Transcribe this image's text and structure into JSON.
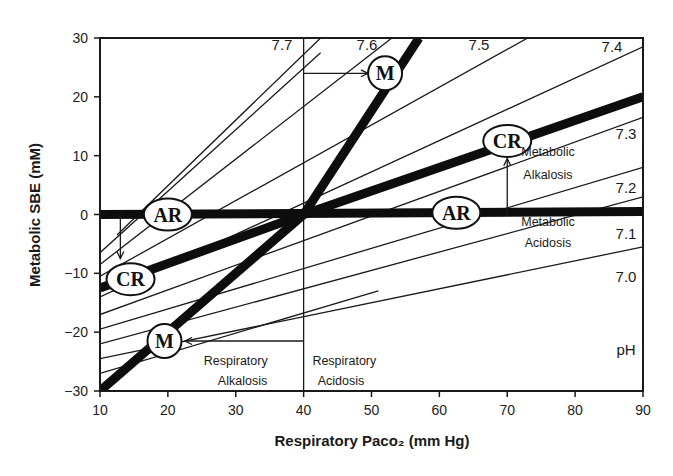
{
  "chart_data": {
    "type": "line",
    "title": "",
    "xlabel": "Respiratory Paco₂ (mm Hg)",
    "ylabel": "Metabolic SBE (mM)",
    "xlim": [
      10,
      90
    ],
    "ylim": [
      -30,
      30
    ],
    "x_ticks": [
      10,
      20,
      30,
      40,
      50,
      60,
      70,
      80,
      90
    ],
    "y_ticks": [
      30,
      20,
      10,
      0,
      -10,
      -20,
      -30
    ],
    "x_tick_labels": [
      "10",
      "20",
      "30",
      "40",
      "50",
      "60",
      "70",
      "80",
      "90"
    ],
    "y_tick_labels": [
      "30",
      "20",
      "10",
      "0",
      "−10",
      "−20",
      "−30"
    ],
    "grid": false,
    "reference_line_x": 40,
    "isopleth_axis_label": "pH",
    "ph_isopleths": [
      {
        "ph": "7.7",
        "points": [
          [
            12.5,
            -3.5
          ],
          [
            42.5,
            30
          ]
        ]
      },
      {
        "ph": "7.7",
        "points": [
          [
            10,
            -6.5
          ],
          [
            42.5,
            27.5
          ]
        ],
        "note": "segment below 7.7 label"
      },
      {
        "ph": "7.6",
        "points": [
          [
            10,
            -8.5
          ],
          [
            53,
            30
          ]
        ]
      },
      {
        "ph": "7.5",
        "points": [
          [
            10,
            -10.5
          ],
          [
            73,
            30
          ]
        ]
      },
      {
        "ph": "7.4",
        "points": [
          [
            10,
            -14
          ],
          [
            90,
            28.5
          ]
        ]
      },
      {
        "ph": "7.3",
        "points": [
          [
            10,
            -17
          ],
          [
            90,
            16.5
          ]
        ]
      },
      {
        "ph": "7.2",
        "points": [
          [
            10,
            -19.5
          ],
          [
            90,
            8
          ]
        ]
      },
      {
        "ph": "7.1",
        "points": [
          [
            10,
            -22
          ],
          [
            90,
            3
          ]
        ]
      },
      {
        "ph": "7.0",
        "points": [
          [
            10,
            -24.5
          ],
          [
            90,
            -5.5
          ]
        ]
      },
      {
        "ph": "",
        "points": [
          [
            10,
            -27
          ],
          [
            51,
            -13
          ]
        ]
      }
    ],
    "series": [
      {
        "name": "AR (acute respiratory)",
        "style": "thick",
        "points": [
          [
            10,
            0
          ],
          [
            90,
            0.5
          ]
        ]
      },
      {
        "name": "CR (chronic respiratory)",
        "style": "thick",
        "points": [
          [
            10,
            -12.5
          ],
          [
            40,
            0
          ],
          [
            90,
            20
          ]
        ]
      },
      {
        "name": "M (metabolic)",
        "style": "thick",
        "points": [
          [
            10,
            -30
          ],
          [
            40,
            0
          ],
          [
            57,
            30
          ]
        ]
      }
    ],
    "markers": [
      {
        "label": "AR",
        "x": 20,
        "y": 0
      },
      {
        "label": "AR",
        "x": 62.5,
        "y": 0.3
      },
      {
        "label": "CR",
        "x": 14.5,
        "y": -11
      },
      {
        "label": "CR",
        "x": 70,
        "y": 12.5
      },
      {
        "label": "M",
        "x": 19.5,
        "y": -21.5
      },
      {
        "label": "M",
        "x": 52,
        "y": 24
      }
    ],
    "arrows": [
      {
        "from": [
          40,
          24
        ],
        "to": [
          49.5,
          24
        ],
        "desc": "Respiratory acidosis arrow to M"
      },
      {
        "from": [
          40,
          -21.5
        ],
        "to": [
          22.5,
          -21.5
        ],
        "desc": "Respiratory alkalosis arrow to M"
      },
      {
        "from": [
          13,
          0
        ],
        "to": [
          13,
          -7.5
        ],
        "desc": "AR down to CR"
      },
      {
        "from": [
          70,
          0
        ],
        "to": [
          70,
          9.5
        ],
        "desc": "AR up to CR"
      }
    ],
    "annotations": [
      {
        "text": "Metabolic",
        "x": 76,
        "y": 10
      },
      {
        "text": "Alkalosis",
        "x": 76,
        "y": 6
      },
      {
        "text": "Metabolic",
        "x": 76,
        "y": -2
      },
      {
        "text": "Acidosis",
        "x": 76,
        "y": -5.5
      },
      {
        "text": "Respiratory",
        "x": 30,
        "y": -25.5
      },
      {
        "text": "Alkalosis",
        "x": 31,
        "y": -29
      },
      {
        "text": "Respiratory",
        "x": 46,
        "y": -25.5
      },
      {
        "text": "Acidosis",
        "x": 45.5,
        "y": -29
      }
    ],
    "ph_labels": [
      {
        "text": "7.7",
        "px": [
          282,
          50
        ]
      },
      {
        "text": "7.6",
        "px": [
          367,
          50
        ]
      },
      {
        "text": "7.5",
        "px": [
          479,
          50
        ]
      },
      {
        "text": "7.4",
        "px": [
          612,
          52
        ]
      },
      {
        "text": "7.3",
        "px": [
          626,
          139
        ]
      },
      {
        "text": "7.2",
        "px": [
          626,
          193
        ]
      },
      {
        "text": "7.1",
        "px": [
          626,
          239
        ]
      },
      {
        "text": "7.0",
        "px": [
          626,
          282
        ]
      },
      {
        "text": "pH",
        "px": [
          626,
          355
        ]
      }
    ]
  }
}
